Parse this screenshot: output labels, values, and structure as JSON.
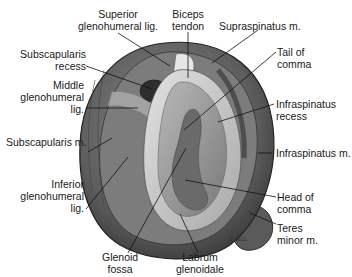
{
  "figure": {
    "labels": {
      "superior_glenohumeral": [
        "Superior",
        "glenohumeral lig."
      ],
      "biceps_tendon": [
        "Biceps",
        "tendon"
      ],
      "supraspinatus": [
        "Supraspinatus m."
      ],
      "subscapularis_recess": [
        "Subscapularis",
        "recess"
      ],
      "tail_of_comma": [
        "Tail of",
        "comma"
      ],
      "middle_glenohumeral": [
        "Middle",
        "glenohumeral",
        "lig."
      ],
      "infraspinatus_recess": [
        "Infraspinatus",
        "recess"
      ],
      "subscapularis_m": [
        "Subscapularis m."
      ],
      "infraspinatus_m": [
        "Infraspinatus m."
      ],
      "inferior_glenohumeral": [
        "Inferior",
        "glenohumeral",
        "lig."
      ],
      "head_of_comma": [
        "Head of",
        "comma"
      ],
      "teres_minor": [
        "Teres",
        "minor m."
      ],
      "glenoid_fossa": [
        "Glenoid",
        "fossa"
      ],
      "labrum_glenoidale": [
        "Labrum",
        "glenoidale"
      ]
    },
    "signature": "E.BELL",
    "colors": {
      "outer_muscle": "#5a5a5a",
      "capsule": "#7a7a7a",
      "labrum": "#c9c9c9",
      "fossa": "#9a9a9a",
      "comma": "#6e6e6e",
      "leader": "#111111"
    }
  }
}
